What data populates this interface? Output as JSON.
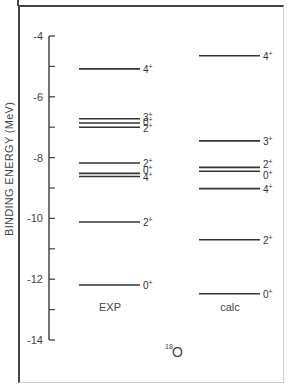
{
  "chart_data": {
    "type": "level-diagram",
    "title": "18O",
    "title_mass_number": "18",
    "title_element": "O",
    "ylabel": "BINDING ENERGY (MeV)",
    "xlabel": "",
    "ylim": [
      -14,
      -4
    ],
    "yticks": [
      -4,
      -6,
      -8,
      -10,
      -12,
      -14
    ],
    "ytick_labels": [
      "-4",
      "-6",
      "-8",
      "-10",
      "-12",
      "-14"
    ],
    "minor_ticks": [
      -5,
      -7,
      -9,
      -11,
      -13
    ],
    "grid": false,
    "series": [
      {
        "name": "EXP",
        "levels": [
          {
            "energy": -5.08,
            "label": "4+"
          },
          {
            "energy": -6.72,
            "label": "3+"
          },
          {
            "energy": -6.86,
            "label": "0+"
          },
          {
            "energy": -7.0,
            "label": "2+"
          },
          {
            "energy": -8.18,
            "label": "2+"
          },
          {
            "energy": -8.52,
            "label": "0+"
          },
          {
            "energy": -8.62,
            "label": "4+"
          },
          {
            "energy": -10.12,
            "label": "2+"
          },
          {
            "energy": -12.19,
            "label": "0+"
          }
        ]
      },
      {
        "name": "calc",
        "levels": [
          {
            "energy": -4.65,
            "label": "4+"
          },
          {
            "energy": -7.45,
            "label": "3+"
          },
          {
            "energy": -8.32,
            "label": "2+"
          },
          {
            "energy": -8.45,
            "label": "0+"
          },
          {
            "energy": -9.02,
            "label": "4+"
          },
          {
            "energy": -10.7,
            "label": "2+"
          },
          {
            "energy": -12.48,
            "label": "0+"
          }
        ]
      }
    ]
  },
  "labels": {
    "ylabel": "BINDING ENERGY (MeV)",
    "exp": "EXP",
    "calc": "calc",
    "nucleus_mass": "18",
    "nucleus_symbol": "O"
  }
}
